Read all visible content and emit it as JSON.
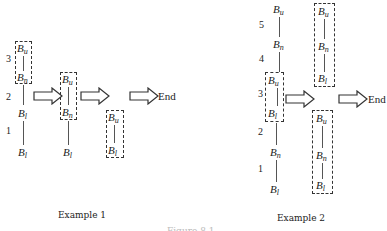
{
  "example1": {
    "caption": "Example 1",
    "stage1": {
      "levels": [
        "3",
        "2",
        "1"
      ],
      "nodes": [
        {
          "base": "B",
          "sub": "u"
        },
        {
          "base": "B",
          "sub": "n"
        },
        {
          "base": "B",
          "sub": "l"
        },
        {
          "base": "B",
          "sub": "l"
        }
      ]
    },
    "stage2": {
      "nodes": [
        {
          "base": "B",
          "sub": "u"
        },
        {
          "base": "B",
          "sub": "n"
        },
        {
          "base": "B",
          "sub": "l"
        }
      ]
    },
    "stage3": {
      "nodes": [
        {
          "base": "B",
          "sub": "u"
        },
        {
          "base": "B",
          "sub": "l"
        }
      ]
    },
    "end_label": "End"
  },
  "example2": {
    "caption": "Example 2",
    "stage1": {
      "levels": [
        "5",
        "4",
        "3",
        "2",
        "1"
      ],
      "nodes": [
        {
          "base": "B",
          "sub": "u"
        },
        {
          "base": "B",
          "sub": "n"
        },
        {
          "base": "B",
          "sub": "u"
        },
        {
          "base": "B",
          "sub": "l"
        },
        {
          "base": "B",
          "sub": "n"
        },
        {
          "base": "B",
          "sub": "l"
        }
      ]
    },
    "stage2_top": {
      "nodes": [
        {
          "base": "B",
          "sub": "u"
        },
        {
          "base": "B",
          "sub": "n"
        },
        {
          "base": "B",
          "sub": "l"
        }
      ]
    },
    "stage2_bottom": {
      "nodes": [
        {
          "base": "B",
          "sub": "u"
        },
        {
          "base": "B",
          "sub": "n"
        },
        {
          "base": "B",
          "sub": "l"
        }
      ]
    },
    "end_label": "End"
  },
  "figure_caption_partial": "Figure 8.1"
}
